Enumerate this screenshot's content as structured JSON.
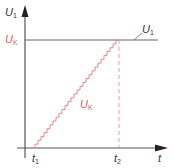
{
  "diagram": {
    "y_axis_label_main": "U",
    "y_axis_label_main_sub": "1",
    "y_axis_label_ref": "U",
    "y_axis_label_ref_sub": "K",
    "x_axis_label": "t",
    "t1_label": "t",
    "t1_sub": "1",
    "t2_label": "t",
    "t2_sub": "2",
    "curve_U1_label": "U",
    "curve_U1_sub": "1",
    "curve_UK_label": "U",
    "curve_UK_sub": "K",
    "colors": {
      "axis": "#555555",
      "u1_line": "#666666",
      "uk_ramp": "#e8858a",
      "uk_label": "#e05560",
      "text": "#333333"
    },
    "ramp_steps": 28
  }
}
